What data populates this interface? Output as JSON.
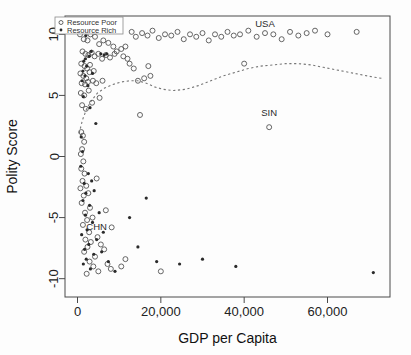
{
  "chart_data": {
    "type": "scatter",
    "title": "",
    "xlabel": "GDP per Capita",
    "ylabel": "Polity Score",
    "xlim": [
      -3000,
      75000
    ],
    "ylim": [
      -11.5,
      11.5
    ],
    "xticks": [
      0,
      20000,
      40000,
      60000
    ],
    "xticklabels": [
      "0",
      "20,000",
      "40,000",
      "60,000"
    ],
    "yticks": [
      10,
      5,
      0,
      -5,
      -10
    ],
    "yticklabels": [
      "10",
      "5",
      "0",
      "-5",
      "-10"
    ],
    "grid": false,
    "legend_position": "top-left",
    "series": [
      {
        "name": "Resource Poor",
        "marker": "open-circle",
        "color": "#555555",
        "points": [
          [
            600,
            10.0
          ],
          [
            1500,
            9.6
          ],
          [
            2400,
            9.5
          ],
          [
            3100,
            10.0
          ],
          [
            4200,
            9.8
          ],
          [
            5200,
            9.2
          ],
          [
            6200,
            9.5
          ],
          [
            7400,
            9.3
          ],
          [
            8600,
            9.0
          ],
          [
            9400,
            8.6
          ],
          [
            1200,
            8.6
          ],
          [
            1900,
            8.4
          ],
          [
            2600,
            8.3
          ],
          [
            3400,
            8.5
          ],
          [
            4100,
            8.2
          ],
          [
            5000,
            8.4
          ],
          [
            5900,
            8.0
          ],
          [
            6800,
            8.3
          ],
          [
            7800,
            8.1
          ],
          [
            8900,
            8.4
          ],
          [
            900,
            7.6
          ],
          [
            1700,
            7.4
          ],
          [
            2300,
            7.2
          ],
          [
            3000,
            7.5
          ],
          [
            3900,
            7.0
          ],
          [
            700,
            6.8
          ],
          [
            1400,
            6.6
          ],
          [
            2100,
            6.4
          ],
          [
            2900,
            6.9
          ],
          [
            3700,
            6.2
          ],
          [
            1000,
            6.0
          ],
          [
            1800,
            5.9
          ],
          [
            2500,
            6.1
          ],
          [
            4500,
            6.0
          ],
          [
            6000,
            6.2
          ],
          [
            800,
            5.2
          ],
          [
            1600,
            5.0
          ],
          [
            2700,
            5.4
          ],
          [
            5300,
            4.8
          ],
          [
            1100,
            4.2
          ],
          [
            2000,
            3.9
          ],
          [
            3500,
            4.4
          ],
          [
            13000,
            10.2
          ],
          [
            14000,
            9.8
          ],
          [
            15500,
            10.1
          ],
          [
            16800,
            9.9
          ],
          [
            18000,
            10.3
          ],
          [
            19500,
            9.7
          ],
          [
            21000,
            10.0
          ],
          [
            22500,
            9.9
          ],
          [
            24000,
            10.2
          ],
          [
            25500,
            9.6
          ],
          [
            27000,
            10.0
          ],
          [
            28500,
            9.8
          ],
          [
            30000,
            10.1
          ],
          [
            31500,
            9.5
          ],
          [
            33000,
            10.0
          ],
          [
            34500,
            9.8
          ],
          [
            36000,
            10.2
          ],
          [
            37500,
            9.9
          ],
          [
            39000,
            10.0
          ],
          [
            41000,
            10.3
          ],
          [
            43000,
            9.8
          ],
          [
            45000,
            10.1
          ],
          [
            47000,
            10.0
          ],
          [
            49000,
            9.6
          ],
          [
            51000,
            10.2
          ],
          [
            53000,
            9.9
          ],
          [
            55000,
            10.1
          ],
          [
            57000,
            10.3
          ],
          [
            60000,
            10.0
          ],
          [
            67000,
            10.2
          ],
          [
            12000,
            8.0
          ],
          [
            12500,
            7.6
          ],
          [
            13500,
            7.2
          ],
          [
            17000,
            7.4
          ],
          [
            16000,
            6.4
          ],
          [
            17500,
            6.6
          ],
          [
            14500,
            6.2
          ],
          [
            40000,
            7.6
          ],
          [
            11500,
            9.0
          ],
          [
            10500,
            8.8
          ],
          [
            11000,
            8.2
          ],
          [
            15000,
            3.4
          ],
          [
            46000,
            2.4
          ],
          [
            900,
            2.0
          ],
          [
            1300,
            1.7
          ],
          [
            1600,
            1.2
          ],
          [
            1100,
            0.6
          ],
          [
            800,
            0.2
          ],
          [
            1400,
            -0.4
          ],
          [
            900,
            -1.0
          ],
          [
            1700,
            -1.4
          ],
          [
            1200,
            -2.0
          ],
          [
            700,
            -2.6
          ],
          [
            2100,
            -2.4
          ],
          [
            1500,
            -3.2
          ],
          [
            2600,
            -3.0
          ],
          [
            1000,
            -3.8
          ],
          [
            3000,
            -4.2
          ],
          [
            1800,
            -4.6
          ],
          [
            2300,
            -5.2
          ],
          [
            1300,
            -5.6
          ],
          [
            3600,
            -5.0
          ],
          [
            2800,
            -6.2
          ],
          [
            4800,
            -6.6
          ],
          [
            1900,
            -6.8
          ],
          [
            3200,
            -7.0
          ],
          [
            2400,
            -7.4
          ],
          [
            5600,
            -7.2
          ],
          [
            1600,
            -7.8
          ],
          [
            4200,
            -8.2
          ],
          [
            2900,
            -8.6
          ],
          [
            6400,
            -7.6
          ],
          [
            3800,
            -9.0
          ],
          [
            5000,
            -9.4
          ],
          [
            7200,
            -8.8
          ],
          [
            2200,
            -9.6
          ],
          [
            8000,
            -9.2
          ],
          [
            10500,
            -9.0
          ],
          [
            11500,
            -8.4
          ],
          [
            20000,
            -9.4
          ],
          [
            6800,
            -4.4
          ],
          [
            8200,
            -5.8
          ],
          [
            4600,
            -1.8
          ]
        ]
      },
      {
        "name": "Resource Rich",
        "marker": "filled-dot",
        "color": "#2a2a2a",
        "points": [
          [
            2000,
            9.9
          ],
          [
            8800,
            10.4
          ],
          [
            3300,
            8.6
          ],
          [
            5600,
            8.4
          ],
          [
            6400,
            8.3
          ],
          [
            7000,
            8.4
          ],
          [
            2800,
            8.2
          ],
          [
            1900,
            8.0
          ],
          [
            1500,
            7.8
          ],
          [
            2200,
            7.4
          ],
          [
            1300,
            7.0
          ],
          [
            1800,
            6.6
          ],
          [
            3600,
            6.8
          ],
          [
            1100,
            6.2
          ],
          [
            2500,
            5.8
          ],
          [
            1400,
            4.9
          ],
          [
            3000,
            4.0
          ],
          [
            4400,
            2.7
          ],
          [
            900,
            1.6
          ],
          [
            1200,
            0.4
          ],
          [
            800,
            -0.8
          ],
          [
            2600,
            -1.4
          ],
          [
            1600,
            -2.2
          ],
          [
            3400,
            -2.0
          ],
          [
            2000,
            -3.0
          ],
          [
            4000,
            -2.8
          ],
          [
            1300,
            -3.6
          ],
          [
            2900,
            -4.0
          ],
          [
            1900,
            -4.8
          ],
          [
            5200,
            -4.6
          ],
          [
            3600,
            -5.4
          ],
          [
            2300,
            -6.0
          ],
          [
            1000,
            -6.4
          ],
          [
            4600,
            -6.8
          ],
          [
            2700,
            -7.2
          ],
          [
            6200,
            -6.2
          ],
          [
            1700,
            -7.6
          ],
          [
            3900,
            -8.0
          ],
          [
            2100,
            -8.4
          ],
          [
            5800,
            -7.8
          ],
          [
            1400,
            -8.8
          ],
          [
            7400,
            -8.6
          ],
          [
            3100,
            -9.2
          ],
          [
            9000,
            -9.4
          ],
          [
            14500,
            -7.4
          ],
          [
            19000,
            -8.6
          ],
          [
            24500,
            -8.8
          ],
          [
            30000,
            -8.4
          ],
          [
            38000,
            -9.0
          ],
          [
            71000,
            -9.5
          ],
          [
            12500,
            -5.0
          ],
          [
            16500,
            -3.4
          ]
        ]
      }
    ],
    "fit_curve": {
      "name": "loess-smoother",
      "style": "dashed",
      "points": [
        [
          400,
          1.9
        ],
        [
          1200,
          3.0
        ],
        [
          2200,
          3.9
        ],
        [
          3400,
          4.6
        ],
        [
          4800,
          5.2
        ],
        [
          6500,
          5.6
        ],
        [
          8500,
          5.9
        ],
        [
          10500,
          6.1
        ],
        [
          12500,
          6.2
        ],
        [
          14500,
          6.2
        ],
        [
          16500,
          6.0
        ],
        [
          18500,
          5.7
        ],
        [
          20500,
          5.5
        ],
        [
          23000,
          5.4
        ],
        [
          26000,
          5.5
        ],
        [
          29000,
          5.8
        ],
        [
          32000,
          6.2
        ],
        [
          35000,
          6.6
        ],
        [
          38000,
          6.9
        ],
        [
          41000,
          7.2
        ],
        [
          44000,
          7.4
        ],
        [
          47000,
          7.5
        ],
        [
          50000,
          7.6
        ],
        [
          53000,
          7.6
        ],
        [
          56000,
          7.5
        ],
        [
          59000,
          7.3
        ],
        [
          62000,
          7.1
        ],
        [
          65000,
          6.9
        ],
        [
          68000,
          6.7
        ],
        [
          71000,
          6.5
        ],
        [
          73000,
          6.4
        ]
      ]
    },
    "annotations": [
      {
        "label": "USA",
        "x": 45000,
        "y": 10.6
      },
      {
        "label": "SIN",
        "x": 46000,
        "y": 3.3
      },
      {
        "label": "CHN",
        "x": 4600,
        "y": -6.0
      }
    ]
  },
  "legend": {
    "entries": [
      {
        "label": "Resource Poor",
        "marker": "open-circle"
      },
      {
        "label": "Resource Rich",
        "marker": "filled-dot"
      }
    ]
  }
}
